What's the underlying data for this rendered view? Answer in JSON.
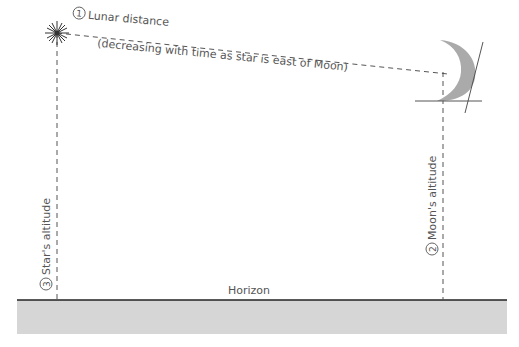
{
  "diagram": {
    "labels": {
      "lunar_distance": {
        "number": "1",
        "text": "Lunar distance"
      },
      "lunar_distance_note": "(decreasing with time as star is east of Moon)",
      "moon_altitude": {
        "number": "2",
        "text": "Moon's altitude"
      },
      "star_altitude": {
        "number": "3",
        "text": "Star's altitude"
      },
      "horizon": "Horizon"
    },
    "objects": [
      "star-symbol",
      "moon-crescent",
      "horizon-line",
      "ground"
    ],
    "colors": {
      "line": "#555555",
      "moon": "#aaaaaa",
      "ground": "#d4d4d4",
      "horizon": "#222222"
    }
  }
}
